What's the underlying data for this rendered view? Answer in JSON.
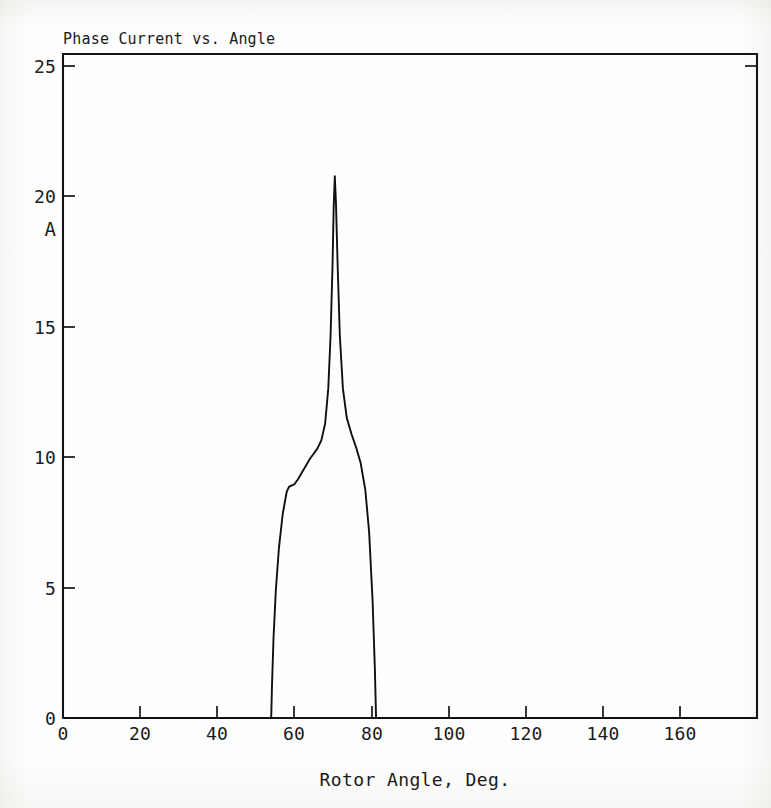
{
  "figure": {
    "title": "Phase Current vs. Angle",
    "y_unit_label": "A",
    "x_axis_title": "Rotor Angle, Deg.",
    "line_color": "#101010",
    "axis_color": "#151515",
    "background_color": "#fdfdfc"
  },
  "chart_data": {
    "type": "line",
    "title": "Phase Current vs. Angle",
    "xlabel": "Rotor Angle, Deg.",
    "ylabel": "A",
    "xlim": [
      0,
      180
    ],
    "ylim": [
      0,
      25
    ],
    "grid": false,
    "legend": null,
    "xticks": [
      0,
      20,
      40,
      60,
      80,
      100,
      120,
      140,
      160
    ],
    "xtick_labels": [
      "0",
      "20",
      "40",
      "60",
      "80",
      "100",
      "120",
      "140",
      "160"
    ],
    "yticks": [
      0,
      5,
      10,
      15,
      20,
      25
    ],
    "ytick_labels": [
      "0",
      "5",
      "10",
      "15",
      "20",
      "25"
    ],
    "series": [
      {
        "name": "Phase Current",
        "x": [
          0,
          54.0,
          54.2,
          54.6,
          55.2,
          56.0,
          57.0,
          58.0,
          58.6,
          59.2,
          60.0,
          61.0,
          62.0,
          63.0,
          64.0,
          65.0,
          66.0,
          67.0,
          68.0,
          68.8,
          69.4,
          69.9,
          70.2,
          70.5,
          70.8,
          71.2,
          71.8,
          72.6,
          73.6,
          74.8,
          76.0,
          77.2,
          78.4,
          79.4,
          80.3,
          80.9,
          81.2,
          180.0
        ],
        "y": [
          0,
          0,
          1.2,
          3.0,
          4.8,
          6.4,
          7.7,
          8.5,
          8.7,
          8.75,
          8.8,
          9.0,
          9.25,
          9.5,
          9.75,
          9.95,
          10.15,
          10.45,
          11.1,
          12.4,
          14.4,
          17.0,
          19.2,
          20.4,
          19.4,
          17.2,
          14.4,
          12.4,
          11.3,
          10.7,
          10.2,
          9.6,
          8.6,
          7.0,
          4.4,
          1.8,
          0,
          0
        ]
      }
    ],
    "annotations": {
      "peak_value": 20.4,
      "peak_angle": 70.5,
      "turn_on_angle": 54.0,
      "turn_off_angle": 81.2,
      "plateau_level": 8.8
    }
  }
}
